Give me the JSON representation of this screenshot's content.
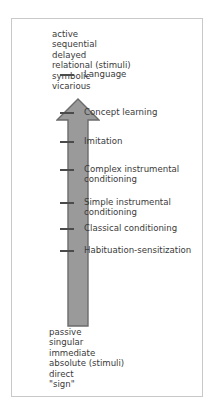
{
  "figure": {
    "colors": {
      "frame_border": "#c9c9c9",
      "arrow_fill": "#9a9a9a",
      "arrow_outline": "#6b6b6b",
      "tick": "#4b4b4b",
      "text": "#3a3a3a",
      "background": "#ffffff"
    },
    "top_pole": {
      "items": [
        "active",
        "sequential",
        "delayed",
        "relational (stimuli)",
        "symbolic",
        "vicarious"
      ]
    },
    "bottom_pole": {
      "items": [
        "passive",
        "singular",
        "immediate",
        "absolute (stimuli)",
        "direct",
        "\"sign\""
      ]
    },
    "arrow": {
      "direction": "up",
      "icon": "upward-arrow-icon"
    },
    "stages": [
      {
        "label": "Language",
        "tick_y": 135
      },
      {
        "label": "Concept learning",
        "tick_y": 173
      },
      {
        "label": "Imitation",
        "tick_y": 202
      },
      {
        "label": "Complex instrumental\nconditioning",
        "tick_y": 230
      },
      {
        "label": "Simple instrumental\nconditioning",
        "tick_y": 263
      },
      {
        "label": "Classical conditioning",
        "tick_y": 289
      },
      {
        "label": "Habituation-sensitization",
        "tick_y": 311
      }
    ]
  }
}
